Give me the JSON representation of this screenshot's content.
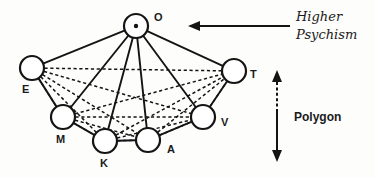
{
  "diagram": {
    "center_node": {
      "id": "O",
      "label": "O",
      "cx": 136,
      "cy": 26,
      "r": 12,
      "has_center_dot": true,
      "label_x": 154,
      "label_y": 21
    },
    "outer_nodes": [
      {
        "id": "E",
        "label": "E",
        "cx": 32,
        "cy": 68,
        "r": 12,
        "label_x": 22,
        "label_y": 93
      },
      {
        "id": "M",
        "label": "M",
        "cx": 63,
        "cy": 117,
        "r": 12,
        "label_x": 56,
        "label_y": 143
      },
      {
        "id": "K",
        "label": "K",
        "cx": 105,
        "cy": 141,
        "r": 12,
        "label_x": 100,
        "label_y": 167
      },
      {
        "id": "A",
        "label": "A",
        "cx": 148,
        "cy": 140,
        "r": 12,
        "label_x": 167,
        "label_y": 153
      },
      {
        "id": "V",
        "label": "V",
        "cx": 203,
        "cy": 117,
        "r": 12,
        "label_x": 221,
        "label_y": 126
      },
      {
        "id": "T",
        "label": "T",
        "cx": 234,
        "cy": 71,
        "r": 12,
        "label_x": 250,
        "label_y": 78
      }
    ],
    "radial_edges": [
      {
        "from": "O",
        "to": "E",
        "style": "solid"
      },
      {
        "from": "O",
        "to": "M",
        "style": "solid"
      },
      {
        "from": "O",
        "to": "K",
        "style": "solid"
      },
      {
        "from": "O",
        "to": "A",
        "style": "solid"
      },
      {
        "from": "O",
        "to": "V",
        "style": "solid"
      },
      {
        "from": "O",
        "to": "T",
        "style": "solid"
      }
    ],
    "perimeter_edges": [
      {
        "from": "E",
        "to": "M",
        "style": "solid"
      },
      {
        "from": "M",
        "to": "K",
        "style": "solid"
      },
      {
        "from": "K",
        "to": "A",
        "style": "solid"
      },
      {
        "from": "A",
        "to": "V",
        "style": "solid"
      },
      {
        "from": "V",
        "to": "T",
        "style": "solid"
      }
    ],
    "mesh_edges": [
      {
        "from": "E",
        "to": "M",
        "style": "dashed"
      },
      {
        "from": "E",
        "to": "K",
        "style": "dashed"
      },
      {
        "from": "E",
        "to": "A",
        "style": "dashed"
      },
      {
        "from": "E",
        "to": "V",
        "style": "dashed"
      },
      {
        "from": "E",
        "to": "T",
        "style": "dashed"
      },
      {
        "from": "M",
        "to": "K",
        "style": "dashed"
      },
      {
        "from": "M",
        "to": "A",
        "style": "dashed"
      },
      {
        "from": "M",
        "to": "V",
        "style": "dashed"
      },
      {
        "from": "M",
        "to": "T",
        "style": "dashed"
      },
      {
        "from": "K",
        "to": "A",
        "style": "dashed"
      },
      {
        "from": "K",
        "to": "V",
        "style": "dashed"
      },
      {
        "from": "K",
        "to": "T",
        "style": "dashed"
      },
      {
        "from": "A",
        "to": "V",
        "style": "dashed"
      },
      {
        "from": "A",
        "to": "T",
        "style": "dashed"
      },
      {
        "from": "V",
        "to": "T",
        "style": "dashed"
      }
    ]
  },
  "annotations": {
    "higher_psychism": {
      "line1": "Higher",
      "line2": "Psychism",
      "arrow_direction": "left",
      "arrow_style": "solid"
    },
    "polygon": {
      "label": "Polygon",
      "arrow_direction": "vertical-double",
      "arrow_top_style": "dashed",
      "arrow_bottom_style": "solid"
    }
  },
  "colors": {
    "ink": "#141414",
    "paper": "#fdfdfc"
  }
}
